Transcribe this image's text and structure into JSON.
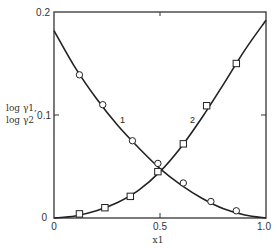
{
  "chart_data": {
    "type": "line",
    "title": "",
    "xlabel": "x1",
    "ylabel": "log γ1, log γ2",
    "xlim": [
      0,
      1.0
    ],
    "ylim": [
      0,
      0.2
    ],
    "x_ticks": [
      "0",
      "0.5",
      "1.0"
    ],
    "y_ticks": [
      "0",
      "0.1",
      "0.2"
    ],
    "grid": false,
    "legend": "none (inline curve labels '1' and '2')",
    "series": [
      {
        "name": "1",
        "quantity": "log γ1",
        "marker": "circle",
        "points": [
          {
            "x": 0.12,
            "y": 0.139
          },
          {
            "x": 0.23,
            "y": 0.11
          },
          {
            "x": 0.37,
            "y": 0.075
          },
          {
            "x": 0.49,
            "y": 0.053
          },
          {
            "x": 0.61,
            "y": 0.034
          },
          {
            "x": 0.74,
            "y": 0.016
          },
          {
            "x": 0.86,
            "y": 0.007
          }
        ],
        "curve": [
          {
            "x": 0.0,
            "y": 0.182
          },
          {
            "x": 0.1,
            "y": 0.146
          },
          {
            "x": 0.2,
            "y": 0.116
          },
          {
            "x": 0.3,
            "y": 0.09
          },
          {
            "x": 0.4,
            "y": 0.068
          },
          {
            "x": 0.5,
            "y": 0.048
          },
          {
            "x": 0.6,
            "y": 0.032
          },
          {
            "x": 0.7,
            "y": 0.019
          },
          {
            "x": 0.8,
            "y": 0.009
          },
          {
            "x": 0.9,
            "y": 0.003
          },
          {
            "x": 1.0,
            "y": 0.0
          }
        ]
      },
      {
        "name": "2",
        "quantity": "log γ2",
        "marker": "square",
        "points": [
          {
            "x": 0.12,
            "y": 0.004
          },
          {
            "x": 0.24,
            "y": 0.01
          },
          {
            "x": 0.36,
            "y": 0.021
          },
          {
            "x": 0.49,
            "y": 0.045
          },
          {
            "x": 0.61,
            "y": 0.072
          },
          {
            "x": 0.72,
            "y": 0.109
          },
          {
            "x": 0.86,
            "y": 0.15
          }
        ],
        "curve": [
          {
            "x": 0.0,
            "y": 0.0
          },
          {
            "x": 0.1,
            "y": 0.002
          },
          {
            "x": 0.2,
            "y": 0.007
          },
          {
            "x": 0.3,
            "y": 0.015
          },
          {
            "x": 0.4,
            "y": 0.027
          },
          {
            "x": 0.5,
            "y": 0.045
          },
          {
            "x": 0.6,
            "y": 0.069
          },
          {
            "x": 0.7,
            "y": 0.098
          },
          {
            "x": 0.8,
            "y": 0.13
          },
          {
            "x": 0.9,
            "y": 0.163
          },
          {
            "x": 1.0,
            "y": 0.192
          }
        ]
      }
    ]
  },
  "labels": {
    "y_tick_0": "0",
    "y_tick_1": "0.1",
    "y_tick_2": "0.2",
    "x_tick_0": "0",
    "x_tick_1": "0.5",
    "x_tick_2": "1.0",
    "ylabel_line1": "log γ1,",
    "ylabel_line2": "log γ2",
    "xlabel": "x1",
    "curve1_label": "1",
    "curve2_label": "2"
  },
  "style": {
    "line_color": "#222222",
    "frame_color": "#333333",
    "background": "#ffffff"
  }
}
